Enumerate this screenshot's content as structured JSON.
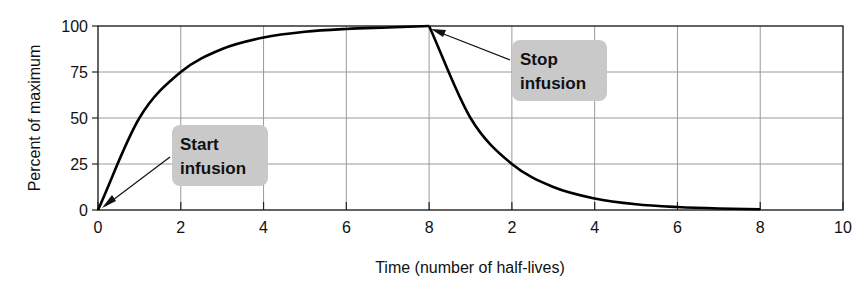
{
  "chart_data": {
    "type": "line",
    "title": "",
    "xlabel": "Time (number of half-lives)",
    "ylabel": "Percent of maximum",
    "xlim": [
      0,
      18
    ],
    "ylim": [
      0,
      100
    ],
    "grid": true,
    "x_ticks": [
      0,
      2,
      4,
      6,
      8,
      10,
      12,
      14,
      16,
      18
    ],
    "x_tick_labels": [
      "0",
      "2",
      "4",
      "6",
      "8",
      "2",
      "4",
      "6",
      "8",
      "10"
    ],
    "y_ticks": [
      0,
      25,
      50,
      75,
      100
    ],
    "y_tick_labels": [
      "0",
      "25",
      "50",
      "75",
      "100"
    ],
    "series": [
      {
        "name": "Infusion accumulation",
        "x": [
          0,
          1,
          2,
          3,
          4,
          5,
          6,
          7,
          8
        ],
        "y": [
          0,
          50,
          75,
          87.5,
          93.75,
          96.9,
          98.4,
          99.2,
          100
        ]
      },
      {
        "name": "Elimination after stop",
        "x": [
          8,
          9,
          10,
          11,
          12,
          13,
          14,
          15,
          16
        ],
        "y": [
          100,
          50,
          25,
          12.5,
          6.25,
          3.1,
          1.6,
          0.8,
          0.4
        ]
      }
    ],
    "annotations": [
      {
        "text_lines": [
          "Start",
          "infusion"
        ],
        "points_to": [
          0,
          0
        ]
      },
      {
        "text_lines": [
          "Stop",
          "infusion"
        ],
        "points_to": [
          8,
          100
        ]
      }
    ]
  }
}
